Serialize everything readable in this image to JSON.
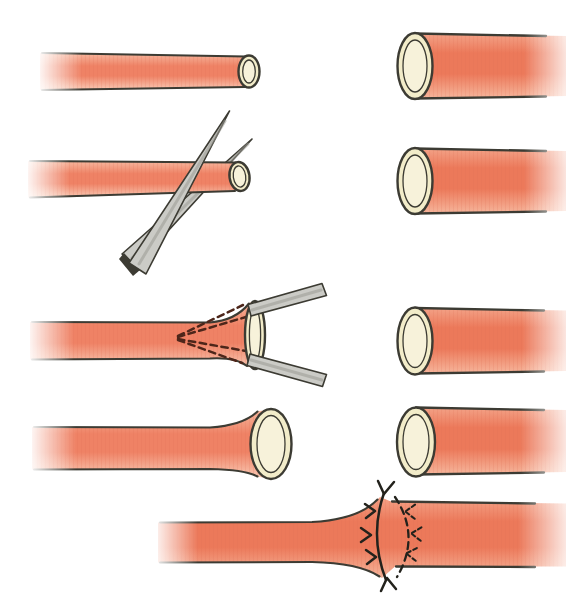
{
  "figure": {
    "kind": "medical-illustration",
    "panels": [
      {
        "id": "small-vessel-transected",
        "row": 1,
        "side": "left"
      },
      {
        "id": "large-vessel-open-end",
        "row": 1,
        "side": "right"
      },
      {
        "id": "scissors-trimming-small-vessel",
        "row": 2,
        "side": "left"
      },
      {
        "id": "large-vessel-open-end",
        "row": 2,
        "side": "right"
      },
      {
        "id": "forceps-dilating-small-vessel",
        "row": 3,
        "side": "left"
      },
      {
        "id": "large-vessel-open-end",
        "row": 3,
        "side": "right"
      },
      {
        "id": "small-vessel-flared-end",
        "row": 4,
        "side": "left"
      },
      {
        "id": "large-vessel-open-end",
        "row": 4,
        "side": "right"
      },
      {
        "id": "completed-anastomosis-with-sutures",
        "row": 5,
        "side": "center"
      }
    ]
  },
  "colors": {
    "background": "#ffffff",
    "outline": "#3c3b33",
    "vessel_small_top": "#f6b89f",
    "vessel_small_mid": "#ef8265",
    "vessel_small_bottom": "#f9c9b4",
    "vessel_large_top": "#f3a287",
    "vessel_large_mid": "#ec795a",
    "vessel_large_bottom": "#f6b69c",
    "lumen_wall": "#f2ecc9",
    "lumen_inner": "#f7f2da",
    "instrument_fill": "#cbcbc6",
    "instrument_shade": "#9a9a93",
    "suture_thread": "#23221c",
    "forceps_dash": "#4d261a",
    "striation": "#d96a4f"
  }
}
